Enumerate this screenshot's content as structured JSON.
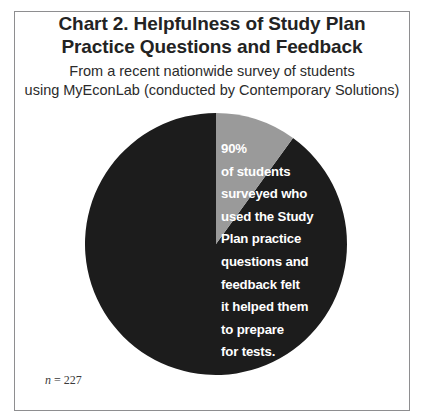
{
  "figure": {
    "title_line_1": "Chart 2. Helpfulness of Study Plan",
    "title_line_2": "Practice Questions and Feedback",
    "subtitle_line_1": "From a recent nationwide survey of students",
    "subtitle_line_2": "using MyEconLab (conducted by Contemporary Solutions)",
    "footnote_symbol": "n",
    "footnote_equals": "=",
    "footnote_value": "227",
    "background_color": "#ffffff",
    "border_color": "#8e8e90"
  },
  "callout": {
    "lines": [
      "90%",
      "of students",
      "surveyed who",
      "used the Study",
      "Plan practice",
      "questions and",
      "feedback felt",
      "it helped them",
      "to prepare",
      "for tests."
    ],
    "text_color": "#ffffff"
  },
  "chart_data": {
    "type": "pie",
    "title": "Chart 2. Helpfulness of Study Plan Practice Questions and Feedback",
    "subtitle": "From a recent nationwide survey of students using MyEconLab (conducted by Contemporary Solutions)",
    "categories": [
      "Felt Study Plan practice questions and feedback helped them prepare for tests",
      "Did not"
    ],
    "values": [
      90,
      10
    ],
    "value_labels": [
      "90%",
      "10%"
    ],
    "colors": [
      "#1c1c1c",
      "#9a9a9a"
    ],
    "start_angle_deg": 0,
    "direction": "counterclockwise",
    "legend": "none",
    "grid": false,
    "annotations": [
      "90% of students surveyed who used the Study Plan practice questions and feedback felt it helped them to prepare for tests.",
      "n = 227"
    ],
    "sample_size": 227
  }
}
